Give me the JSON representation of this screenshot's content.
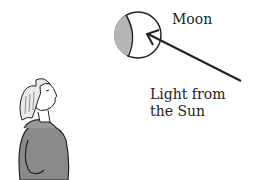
{
  "diagram": {
    "labels": {
      "moon": "Moon",
      "light_line1": "Light from",
      "light_line2": "the Sun"
    },
    "elements": {
      "moon": {
        "shape": "circle",
        "lit_side": "right",
        "shaded_side": "left",
        "shade_color": "#b5b5b5"
      },
      "arrow": {
        "direction": "toward-moon",
        "from": "lower-right",
        "to": "moon"
      },
      "observer": {
        "description": "person looking up toward the moon",
        "coat_color": "#8a8a8a"
      }
    },
    "colors": {
      "ink": "#222222",
      "background": "#ffffff",
      "shade": "#b5b5b5"
    }
  }
}
